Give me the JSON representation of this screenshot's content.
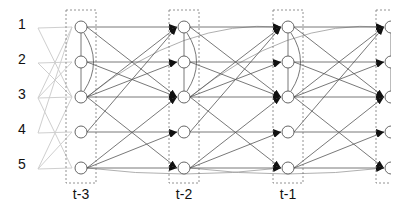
{
  "diagram": {
    "type": "dynamic-bayesian-network",
    "row_labels": [
      "1",
      "2",
      "3",
      "4",
      "5"
    ],
    "time_slices": [
      {
        "label": "t-3",
        "x": 81
      },
      {
        "label": "t-2",
        "x": 184
      },
      {
        "label": "t-1",
        "x": 288
      },
      {
        "label": "",
        "x": 391
      }
    ],
    "row_y": [
      27,
      62,
      97,
      132,
      168
    ],
    "colors": {
      "edge": "#555555",
      "faint_edge": "#cfcfcf",
      "node_stroke": "#555555",
      "box_stroke": "#777777",
      "arrow": "#111111"
    },
    "intra_slice_edges": [
      [
        0,
        1
      ],
      [
        1,
        2
      ]
    ],
    "intra_slice_arcs": [
      [
        0,
        2
      ]
    ],
    "inter_slice_edges": [
      [
        0,
        0
      ],
      [
        0,
        2
      ],
      [
        1,
        1
      ],
      [
        1,
        2
      ],
      [
        2,
        0
      ],
      [
        2,
        1
      ],
      [
        2,
        2
      ],
      [
        2,
        4
      ],
      [
        3,
        3
      ],
      [
        3,
        0
      ],
      [
        4,
        3
      ],
      [
        4,
        4
      ],
      [
        4,
        2
      ]
    ],
    "skip_edges": [
      [
        2,
        0
      ],
      [
        4,
        4
      ]
    ]
  }
}
